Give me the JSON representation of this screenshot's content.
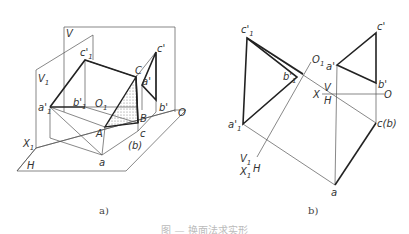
{
  "figure_a": {
    "caption": "a)",
    "labels": {
      "V": "V",
      "V1": "V",
      "V1_sub": "1",
      "H": "H",
      "X1": "X",
      "X1_sub": "1",
      "O": "O",
      "O1": "O",
      "O1_sub": "1",
      "c1p": "c'",
      "c1p_sub": "1",
      "a1p": "a'",
      "a1p_sub": "1",
      "b1p": "b'",
      "b1p_sub": "1",
      "C": "C",
      "A": "A",
      "B": "B",
      "ap": "a'",
      "bp": "b'",
      "cp": "c'",
      "a": "a",
      "c": "c",
      "b_paren": "(b)"
    }
  },
  "figure_b": {
    "caption": "b)",
    "labels": {
      "c1p": "c'",
      "c1p_sub": "1",
      "b1p": "b'",
      "b1p_sub": "1",
      "a1p": "a'",
      "a1p_sub": "1",
      "O1": "O",
      "O1_sub": "1",
      "ap": "a'",
      "cp": "c'",
      "bp": "b'",
      "X": "X",
      "V": "V",
      "H": "H",
      "O": "O",
      "cb": "c(b)",
      "a": "a",
      "V1": "V",
      "V1_sub": "1",
      "X1": "X",
      "X1_sub": "1",
      "H2": "H"
    }
  },
  "figure_caption": "图 — 换面法求实形"
}
